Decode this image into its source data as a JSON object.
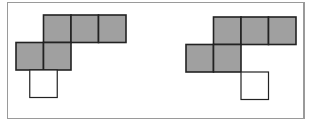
{
  "figure": {
    "colors": {
      "filled": "#a0a0a0",
      "empty": "#ffffff",
      "stroke": "#222222",
      "frame": "#9a9a9a"
    },
    "nets": [
      {
        "name": "left-net",
        "cells": [
          {
            "col": 1,
            "row": 0,
            "filled": true
          },
          {
            "col": 2,
            "row": 0,
            "filled": true
          },
          {
            "col": 3,
            "row": 0,
            "filled": true
          },
          {
            "col": 0,
            "row": 1,
            "filled": true
          },
          {
            "col": 1,
            "row": 1,
            "filled": true
          },
          {
            "col": 0.5,
            "row": 2,
            "filled": false
          }
        ]
      },
      {
        "name": "right-net",
        "cells": [
          {
            "col": 1,
            "row": 0,
            "filled": true
          },
          {
            "col": 2,
            "row": 0,
            "filled": true
          },
          {
            "col": 3,
            "row": 0,
            "filled": true
          },
          {
            "col": 0,
            "row": 1,
            "filled": true
          },
          {
            "col": 1,
            "row": 1,
            "filled": true
          },
          {
            "col": 2,
            "row": 2,
            "filled": false
          }
        ]
      }
    ]
  }
}
